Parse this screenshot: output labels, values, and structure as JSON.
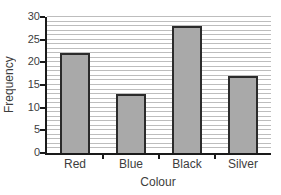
{
  "chart_data": {
    "type": "bar",
    "title": "",
    "xlabel": "Colour",
    "ylabel": "Frequency",
    "categories": [
      "Red",
      "Blue",
      "Black",
      "Silver"
    ],
    "values": [
      22,
      13,
      28,
      17
    ],
    "ylim": [
      0,
      30
    ],
    "ytick_step": 5,
    "yticks": [
      0,
      5,
      10,
      15,
      20,
      25,
      30
    ],
    "grid": "on",
    "grid_step": 1,
    "legend": "none",
    "colors": {
      "bar_fill": "#a9a9a9",
      "bar_border": "#2b2b2b",
      "grid": "#bdbdbd",
      "axis": "#1a1a1a",
      "text": "#3d3d3d"
    }
  }
}
